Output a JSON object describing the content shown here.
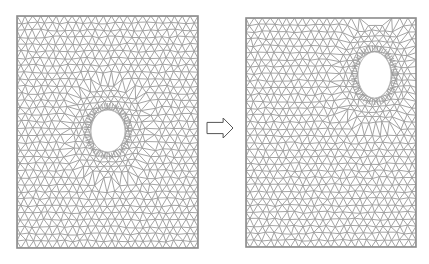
{
  "figure": {
    "width": 429,
    "height": 264,
    "background": "#ffffff",
    "mesh_color": "#9a9a9a",
    "hole_fill": "#ffffff",
    "panels": [
      {
        "name": "mesh-before",
        "rect": {
          "x": 17,
          "y": 16,
          "w": 181,
          "h": 232
        },
        "hole": {
          "cx": 108,
          "cy": 131,
          "rx": 17,
          "ry": 21
        },
        "element_size": 8
      },
      {
        "name": "mesh-after",
        "rect": {
          "x": 246,
          "y": 18,
          "w": 170,
          "h": 229
        },
        "hole": {
          "cx": 374.5,
          "cy": 75,
          "rx": 16.5,
          "ry": 23
        },
        "element_size": 8
      }
    ],
    "arrow": {
      "x": 207,
      "y": 118,
      "w": 26,
      "h": 20,
      "direction": "right",
      "style": "outline"
    }
  }
}
